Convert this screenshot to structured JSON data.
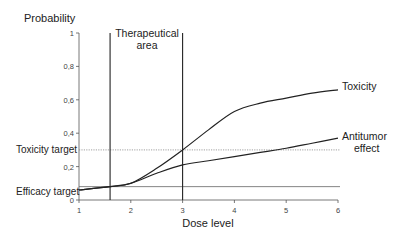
{
  "chart_data": {
    "type": "line",
    "title": "",
    "xlabel": "Dose level",
    "ylabel": "Probability",
    "xlim": [
      1,
      6
    ],
    "ylim": [
      0,
      1
    ],
    "x_ticks": [
      "1",
      "2",
      "3",
      "4",
      "5",
      "6"
    ],
    "y_ticks": [
      "0",
      "0,2",
      "0,4",
      "0,6",
      "0,8",
      "1"
    ],
    "grid": false,
    "legend": "inline labels at line ends",
    "series": [
      {
        "name": "Toxicity",
        "x": [
          1,
          1.6,
          2,
          2.5,
          3,
          3.5,
          4,
          4.5,
          5,
          5.5,
          6
        ],
        "values": [
          0.06,
          0.08,
          0.1,
          0.19,
          0.3,
          0.42,
          0.53,
          0.58,
          0.61,
          0.64,
          0.66
        ]
      },
      {
        "name": "Antitumor effect",
        "x": [
          1,
          1.6,
          2,
          2.5,
          3,
          3.5,
          4,
          4.5,
          5,
          5.5,
          6
        ],
        "values": [
          0.06,
          0.08,
          0.1,
          0.16,
          0.21,
          0.235,
          0.26,
          0.285,
          0.31,
          0.34,
          0.37
        ]
      }
    ],
    "reference_lines": [
      {
        "name": "Toxicity target",
        "axis": "y",
        "value": 0.3,
        "style": "dotted"
      },
      {
        "name": "Efficacy target",
        "axis": "y",
        "value": 0.08,
        "style": "solid"
      }
    ],
    "annotations": [
      {
        "text": "Therapeutical area",
        "x_range": [
          1.6,
          3
        ],
        "style": "vertical lines bounding region"
      }
    ]
  },
  "labels": {
    "ylabel": "Probability",
    "xlabel": "Dose level",
    "therapeutic_line1": "Therapeutical",
    "therapeutic_line2": "area",
    "toxicity": "Toxicity",
    "antitumor_line1": "Antitumor",
    "antitumor_line2": "effect",
    "toxicity_target": "Toxicity target",
    "efficacy_target": "Efficacy target"
  }
}
